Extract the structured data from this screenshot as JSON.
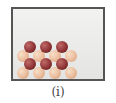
{
  "figure": {
    "caption": "(i)",
    "colors": {
      "dark_sphere": "#8a3030",
      "light_sphere": "#e8b898",
      "frame": "#555555"
    }
  }
}
